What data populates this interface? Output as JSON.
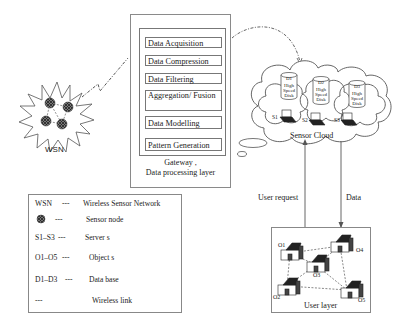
{
  "wsn": {
    "label": "WSN",
    "node_count": 4
  },
  "gateway": {
    "steps": [
      "Data Acquisition",
      "Data Compression",
      "Data Filtering",
      "Aggregation/ Fusion",
      "Data Modelling",
      "Pattern Generation"
    ],
    "caption_line1": "Gateway ,",
    "caption_line2": "Data processing layer"
  },
  "sensor_cloud": {
    "label": "Sensor Cloud",
    "databases": [
      {
        "id": "D1",
        "text": "High Speed Disk"
      },
      {
        "id": "D2",
        "text": "High Speed Disk"
      },
      {
        "id": "D3",
        "text": "High Speed Disk"
      }
    ],
    "servers": [
      "S1",
      "S2",
      "S3"
    ]
  },
  "links": {
    "user_request": "User request",
    "data": "Data"
  },
  "user_layer": {
    "label": "User layer",
    "objects": [
      "O1",
      "O2",
      "O3",
      "O4",
      "O5"
    ]
  },
  "legend": {
    "rows": [
      {
        "key": "WSN",
        "dash": "---",
        "desc": "Wireless Sensor Network"
      },
      {
        "key": "",
        "dash": "---",
        "desc": "Sensor node"
      },
      {
        "key": "S1–S3",
        "dash": "---",
        "desc": "Server s"
      },
      {
        "key": "O1–O5",
        "dash": "---",
        "desc": "Object s"
      },
      {
        "key": "D1–D3",
        "dash": "---",
        "desc": "Data base"
      },
      {
        "key": "",
        "dash": "---",
        "desc": "Wireless link"
      }
    ]
  }
}
